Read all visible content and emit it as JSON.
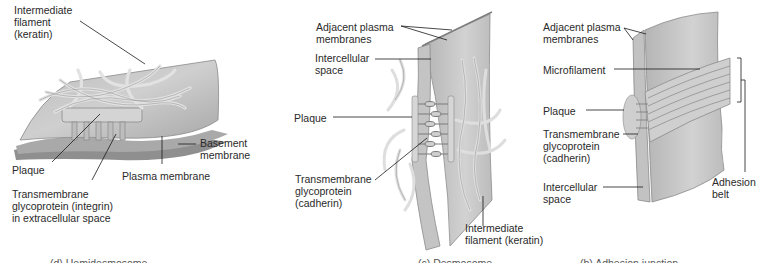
{
  "figure": {
    "panels": [
      {
        "id": "hemidesmosome",
        "labels": {
          "intermediate_filament": "Intermediate\nfilament\n(keratin)",
          "basement_membrane": "Basement\nmembrane",
          "plaque": "Plaque",
          "plasma_membrane": "Plasma membrane",
          "transmembrane": "Transmembrane\nglycoprotein (integrin)\nin extracellular space"
        },
        "caption": "(d) Hemidesmosome"
      },
      {
        "id": "desmosome",
        "labels": {
          "adjacent_membranes": "Adjacent plasma\nmembranes",
          "intercellular_space": "Intercellular\nspace",
          "plaque": "Plaque",
          "transmembrane": "Transmembrane\nglycoprotein\n(cadherin)",
          "intermediate_filament": "Intermediate\nfilament (keratin)"
        },
        "caption": "(c) Desmosome"
      },
      {
        "id": "adhesion-junction",
        "labels": {
          "adjacent_membranes": "Adjacent plasma\nmembranes",
          "microfilament": "Microfilament",
          "plaque": "Plaque",
          "transmembrane": "Transmembrane\nglycoprotein\n(cadherin)",
          "intercellular_space": "Intercellular\nspace",
          "adhesion_belt": "Adhesion\nbelt"
        },
        "caption": "(b) Adhesion junction"
      }
    ],
    "colors": {
      "membrane": "#c9c9c9",
      "membrane_dark": "#9a9a9a",
      "filament": "#d8d8d8",
      "leader_line": "#1a1a1a"
    }
  }
}
